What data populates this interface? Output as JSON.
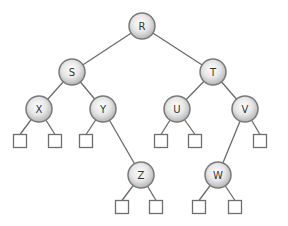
{
  "diagram": {
    "type": "binary-tree",
    "colors": {
      "edge": "#6b6b6b",
      "node_fill_center": "#ffffff",
      "node_fill_edge": "#bdbdbd",
      "node_stroke": "#7a7a7a",
      "leaf_stroke": "#6e6e6e"
    },
    "nodes": [
      {
        "id": "R",
        "label": "R",
        "x": 142,
        "y": 26
      },
      {
        "id": "S",
        "label": "S",
        "x": 72,
        "y": 72
      },
      {
        "id": "T",
        "label": "T",
        "x": 213,
        "y": 72
      },
      {
        "id": "X",
        "label": "X",
        "x": 39,
        "y": 109
      },
      {
        "id": "Y",
        "label": "Y",
        "x": 103,
        "y": 109
      },
      {
        "id": "U",
        "label": "U",
        "x": 177,
        "y": 109
      },
      {
        "id": "V",
        "label": "V",
        "x": 245,
        "y": 109
      },
      {
        "id": "Z",
        "label": "Z",
        "x": 141,
        "y": 175
      },
      {
        "id": "W",
        "label": "W",
        "x": 218,
        "y": 175
      }
    ],
    "edges": [
      [
        "R",
        "S"
      ],
      [
        "R",
        "T"
      ],
      [
        "S",
        "X"
      ],
      [
        "S",
        "Y"
      ],
      [
        "T",
        "U"
      ],
      [
        "T",
        "V"
      ],
      [
        "Y",
        "Z"
      ],
      [
        "V",
        "W"
      ]
    ],
    "leaves": [
      {
        "parent": "X",
        "x": 20,
        "y": 141
      },
      {
        "parent": "X",
        "x": 55,
        "y": 141
      },
      {
        "parent": "Y",
        "x": 86,
        "y": 141
      },
      {
        "parent": "U",
        "x": 161,
        "y": 141
      },
      {
        "parent": "U",
        "x": 195,
        "y": 141
      },
      {
        "parent": "V",
        "x": 260,
        "y": 141
      },
      {
        "parent": "Z",
        "x": 122,
        "y": 207
      },
      {
        "parent": "Z",
        "x": 156,
        "y": 207
      },
      {
        "parent": "W",
        "x": 199,
        "y": 207
      },
      {
        "parent": "W",
        "x": 235,
        "y": 207
      }
    ]
  }
}
